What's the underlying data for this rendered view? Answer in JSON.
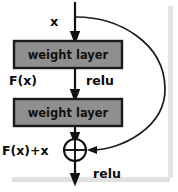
{
  "diagram": {
    "blocks": [
      {
        "id": "weight-layer-1",
        "label": "weight layer"
      },
      {
        "id": "weight-layer-2",
        "label": "weight layer"
      }
    ],
    "labels": {
      "input": "x",
      "residual_output": "F(x)",
      "relu_mid": "relu",
      "sum_output": "F(x)+x",
      "relu_out": "relu"
    },
    "operator": {
      "name": "addition-node",
      "symbol": "+"
    },
    "colors": {
      "block_fill": "#8f8f8f",
      "block_stroke": "#1a1a1a",
      "line": "#111111",
      "background": "#ffffff",
      "border_shadow": "#dcdcdc"
    }
  }
}
